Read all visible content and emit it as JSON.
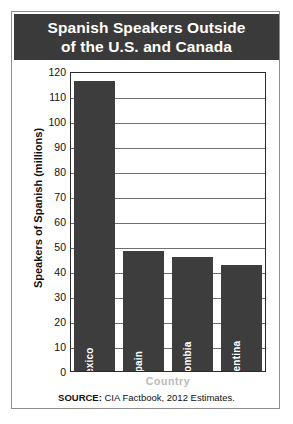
{
  "card": {
    "title_line1": "Spanish Speakers Outside",
    "title_line2": "of the U.S. and Canada",
    "title_bar_color": "#3a3a3a",
    "border_color": "#8d8d8d",
    "background_color": "#ffffff"
  },
  "source": {
    "label": "SOURCE:",
    "text": " CIA Factbook, 2012 Estimates."
  },
  "chart_data": {
    "type": "bar",
    "title": "Spanish Speakers Outside of the U.S. and Canada",
    "xlabel": "Country",
    "ylabel": "Speakers of Spanish (millions)",
    "categories": [
      "Mexico",
      "Spain",
      "Colombia",
      "Argentina"
    ],
    "values": [
      116,
      48,
      45.5,
      42.5
    ],
    "ylim": [
      0,
      120
    ],
    "ytick_step": 10,
    "yticks": [
      120,
      110,
      100,
      90,
      80,
      70,
      60,
      50,
      40,
      30,
      20,
      10,
      0
    ],
    "grid": true,
    "legend": "none",
    "bar_color": "#3d3d3d",
    "bar_label_color": "#ffffff",
    "axis_color": "#2b2b2b",
    "gridline_color": "#6f6f6f"
  }
}
